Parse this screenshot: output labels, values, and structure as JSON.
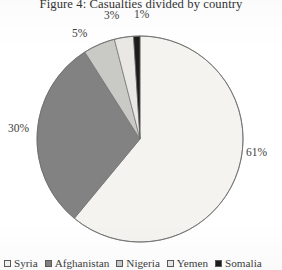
{
  "figure": {
    "title": "Figure 4: Casualties divided by country"
  },
  "chart_data": {
    "type": "pie",
    "title": "Figure 4: Casualties divided by country",
    "xlabel": "",
    "ylabel": "",
    "legend_position": "bottom",
    "grid": false,
    "start_angle_deg": 0,
    "direction": "clockwise",
    "categories": [
      "Syria",
      "Afghanistan",
      "Nigeria",
      "Yemen",
      "Somalia"
    ],
    "values": [
      61,
      30,
      5,
      3,
      1
    ],
    "value_labels": [
      "61%",
      "30%",
      "5%",
      "3%",
      "1%"
    ],
    "colors": [
      "#f4f3ef",
      "#828282",
      "#c9c9c6",
      "#e9e8e4",
      "#1c1c1c"
    ],
    "slices": [
      {
        "name": "Syria",
        "value": 61,
        "label": "61%",
        "color": "#f4f3ef"
      },
      {
        "name": "Afghanistan",
        "value": 30,
        "label": "30%",
        "color": "#828282"
      },
      {
        "name": "Nigeria",
        "value": 5,
        "label": "5%",
        "color": "#c9c9c6"
      },
      {
        "name": "Yemen",
        "value": 3,
        "label": "3%",
        "color": "#e9e8e4"
      },
      {
        "name": "Somalia",
        "value": 1,
        "label": "1%",
        "color": "#1c1c1c"
      }
    ]
  },
  "legend": {
    "items": [
      {
        "label": "Syria",
        "color": "#f4f3ef"
      },
      {
        "label": "Afghanistan",
        "color": "#828282"
      },
      {
        "label": "Nigeria",
        "color": "#c9c9c6"
      },
      {
        "label": "Yemen",
        "color": "#e9e8e4"
      },
      {
        "label": "Somalia",
        "color": "#1c1c1c"
      }
    ]
  },
  "geometry": {
    "center_x": 140,
    "center_y": 139,
    "radius": 103
  }
}
